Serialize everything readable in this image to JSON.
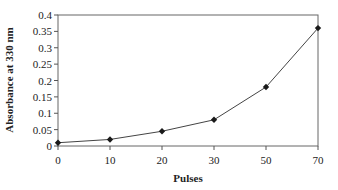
{
  "chart_data": {
    "type": "line",
    "title": "",
    "xlabel": "Pulses",
    "ylabel": "Absorbance at 330 nm",
    "categories": [
      "0",
      "10",
      "20",
      "30",
      "50",
      "70"
    ],
    "series": [
      {
        "name": "Absorbance",
        "values": [
          0.01,
          0.02,
          0.045,
          0.08,
          0.18,
          0.36
        ],
        "color": "#1a1a1a",
        "marker": "diamond"
      }
    ],
    "ylim": [
      0,
      0.4
    ],
    "yticks": [
      "0",
      "0.05",
      "0.1",
      "0.15",
      "0.2",
      "0.25",
      "0.3",
      "0.35",
      "0.4"
    ],
    "grid": false,
    "legend": "none"
  }
}
